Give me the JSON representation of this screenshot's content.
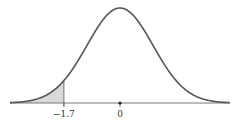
{
  "chart_data": {
    "type": "area",
    "title": "",
    "distribution": {
      "mean": 0,
      "sd": 1
    },
    "shaded_region": {
      "from": "-inf",
      "to": -1.7
    },
    "x_ticks": [
      {
        "value": -1.7,
        "label": "−1.7"
      },
      {
        "value": 0,
        "label": "0"
      }
    ],
    "xlim": [
      -3.3,
      3.3
    ],
    "xlabel": "",
    "ylabel": "",
    "grid": false,
    "colors": {
      "curve": "#555555",
      "shade": "#d9d9d9",
      "axis": "#777777"
    }
  }
}
